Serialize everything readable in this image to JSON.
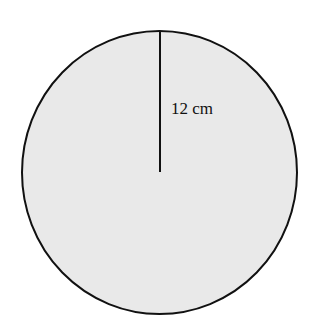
{
  "diagram": {
    "shape": "circle",
    "fill_color": "#e9e9e9",
    "stroke_color": "#111111",
    "radius_label": "12 cm",
    "radius_value": 12,
    "radius_unit": "cm"
  }
}
